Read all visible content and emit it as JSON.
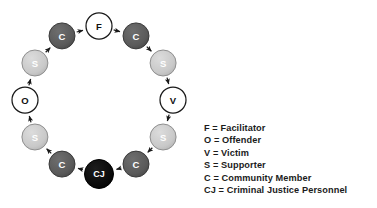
{
  "diagram": {
    "type": "restorative-justice-circle",
    "layout": {
      "center_x": 99,
      "center_y": 100,
      "radius": 74,
      "node_radius": 13,
      "cj_node_radius": 14.5
    },
    "colors": {
      "white_node_fill": "#ffffff",
      "white_node_stroke": "#1a1a1a",
      "white_node_text": "#111111",
      "light_gray_fill": "#c9c9c9",
      "light_gray_stroke": "#8f8f8f",
      "dark_gray_fill": "#5a5a5a",
      "dark_gray_stroke": "#3a3a3a",
      "black_fill": "#0a0a0a",
      "black_stroke": "#000000",
      "node_text_light": "#ffffff",
      "arrow_color": "#1a1a1a",
      "background": "#ffffff"
    },
    "nodes": [
      {
        "id": "n0",
        "label": "F",
        "role": "Facilitator",
        "style": "white",
        "angle_deg": -90
      },
      {
        "id": "n1",
        "label": "C",
        "role": "Community Member",
        "style": "dark-gray",
        "angle_deg": -60
      },
      {
        "id": "n2",
        "label": "S",
        "role": "Supporter",
        "style": "light-gray",
        "angle_deg": -30
      },
      {
        "id": "n3",
        "label": "V",
        "role": "Victim",
        "style": "white",
        "angle_deg": 0
      },
      {
        "id": "n4",
        "label": "S",
        "role": "Supporter",
        "style": "light-gray",
        "angle_deg": 30
      },
      {
        "id": "n5",
        "label": "C",
        "role": "Community Member",
        "style": "dark-gray",
        "angle_deg": 60
      },
      {
        "id": "n6",
        "label": "CJ",
        "role": "Criminal Justice Personnel",
        "style": "black",
        "angle_deg": 90
      },
      {
        "id": "n7",
        "label": "C",
        "role": "Community Member",
        "style": "dark-gray",
        "angle_deg": 120
      },
      {
        "id": "n8",
        "label": "S",
        "role": "Supporter",
        "style": "light-gray",
        "angle_deg": 150
      },
      {
        "id": "n9",
        "label": "O",
        "role": "Offender",
        "style": "white",
        "angle_deg": 180
      },
      {
        "id": "n10",
        "label": "S",
        "role": "Supporter",
        "style": "light-gray",
        "angle_deg": 210
      },
      {
        "id": "n11",
        "label": "C",
        "role": "Community Member",
        "style": "dark-gray",
        "angle_deg": 240
      }
    ],
    "flow_direction": "clockwise",
    "arrows": [
      {
        "from": "n0",
        "to": "n1"
      },
      {
        "from": "n1",
        "to": "n2"
      },
      {
        "from": "n2",
        "to": "n3"
      },
      {
        "from": "n3",
        "to": "n4"
      },
      {
        "from": "n4",
        "to": "n5"
      },
      {
        "from": "n5",
        "to": "n6"
      },
      {
        "from": "n6",
        "to": "n7"
      },
      {
        "from": "n7",
        "to": "n8"
      },
      {
        "from": "n8",
        "to": "n9"
      },
      {
        "from": "n9",
        "to": "n10"
      },
      {
        "from": "n10",
        "to": "n11"
      },
      {
        "from": "n11",
        "to": "n0"
      }
    ]
  },
  "legend": {
    "items": [
      {
        "key": "F",
        "text": "F = Facilitator"
      },
      {
        "key": "O",
        "text": "O = Offender"
      },
      {
        "key": "V",
        "text": "V = Victim"
      },
      {
        "key": "S",
        "text": "S = Supporter"
      },
      {
        "key": "C",
        "text": "C = Community Member"
      },
      {
        "key": "CJ",
        "text": "CJ = Criminal Justice Personnel"
      }
    ]
  }
}
